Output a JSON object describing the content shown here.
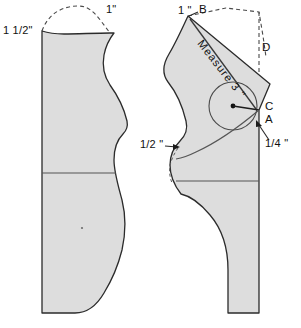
{
  "diagram": {
    "colors": {
      "piece_fill": "#dddddd",
      "outline": "#2b2b2b",
      "dashed": "#4a4a4a",
      "text": "#111111"
    },
    "left_piece": {
      "name": "front-bodice-piece",
      "labels": [
        {
          "id": "left-shoulder-dim",
          "text": "1 1/2\""
        },
        {
          "id": "left-neck-dim",
          "text": "1\""
        }
      ]
    },
    "right_piece": {
      "name": "back-bodice-piece",
      "labels": [
        {
          "id": "right-top-dim",
          "text": "1 \""
        },
        {
          "id": "point-b",
          "text": "B"
        },
        {
          "id": "point-d",
          "text": "D"
        },
        {
          "id": "point-c",
          "text": "C"
        },
        {
          "id": "point-a",
          "text": "A"
        },
        {
          "id": "quarter-dim",
          "text": "1/4 \""
        },
        {
          "id": "half-dim",
          "text": "1/2 \""
        },
        {
          "id": "measure-note",
          "text": "Measure 3 \""
        }
      ]
    }
  }
}
